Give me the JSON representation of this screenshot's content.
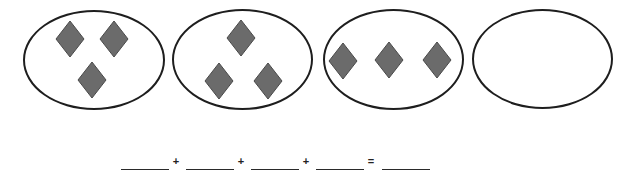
{
  "worksheet": {
    "groups": [
      {
        "label": "group-1",
        "count": 3,
        "ellipse": {
          "x": 23,
          "y": 10,
          "w": 142,
          "h": 100
        },
        "diamonds": [
          {
            "cx": 70,
            "cy": 39
          },
          {
            "cx": 114,
            "cy": 39
          },
          {
            "cx": 92,
            "cy": 80
          }
        ]
      },
      {
        "label": "group-2",
        "count": 3,
        "ellipse": {
          "x": 172,
          "y": 9,
          "w": 141,
          "h": 101
        },
        "diamonds": [
          {
            "cx": 241,
            "cy": 38
          },
          {
            "cx": 219,
            "cy": 81
          },
          {
            "cx": 268,
            "cy": 81
          }
        ]
      },
      {
        "label": "group-3",
        "count": 3,
        "ellipse": {
          "x": 323,
          "y": 9,
          "w": 141,
          "h": 101
        },
        "diamonds": [
          {
            "cx": 343,
            "cy": 61
          },
          {
            "cx": 389,
            "cy": 60
          },
          {
            "cx": 437,
            "cy": 60
          }
        ]
      },
      {
        "label": "group-4",
        "count": 0,
        "ellipse": {
          "x": 472,
          "y": 9,
          "w": 141,
          "h": 100
        },
        "diamonds": []
      }
    ],
    "equation": {
      "blanks": [
        {
          "x": 121,
          "value": ""
        },
        {
          "x": 186,
          "value": ""
        },
        {
          "x": 251,
          "value": ""
        },
        {
          "x": 316,
          "value": ""
        },
        {
          "x": 382,
          "value": ""
        }
      ],
      "operators": [
        {
          "x": 171,
          "symbol": "+"
        },
        {
          "x": 236,
          "symbol": "+"
        },
        {
          "x": 301,
          "symbol": "+"
        },
        {
          "x": 366,
          "symbol": "="
        }
      ]
    },
    "colors": {
      "diamond_fill": "#6b6b6b",
      "diamond_stroke": "#4a4a4a",
      "ellipse_stroke": "#1e1e1e",
      "line": "#2a2a2a"
    }
  }
}
